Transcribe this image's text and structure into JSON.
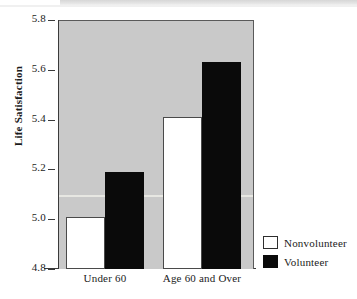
{
  "chart_data": {
    "type": "bar",
    "title": "",
    "subtitle": "",
    "xlabel": "",
    "ylabel": "Life Satisfaction",
    "categories": [
      "Under 60",
      "Age 60 and Over"
    ],
    "series": [
      {
        "name": "Nonvolunteer",
        "color": "#ffffff",
        "values": [
          5.01,
          5.41
        ]
      },
      {
        "name": "Volunteer",
        "color": "#000000",
        "values": [
          5.19,
          5.63
        ]
      }
    ],
    "ylim": [
      4.8,
      5.8
    ],
    "yticks": [
      "5.8",
      "5.6",
      "5.4",
      "5.2",
      "5.0",
      "4.8"
    ],
    "ytick_values": [
      5.8,
      5.6,
      5.4,
      5.2,
      5.0,
      4.8
    ],
    "grid": false,
    "legend_position": "right-bottom",
    "plot_background": "#c9c9c9",
    "axis_color": "#3a3a3a"
  },
  "legend": {
    "entries": [
      {
        "label": "Nonvolunteer",
        "swatch": "white-square-swatch"
      },
      {
        "label": "Volunteer",
        "swatch": "black-square-swatch"
      }
    ]
  }
}
